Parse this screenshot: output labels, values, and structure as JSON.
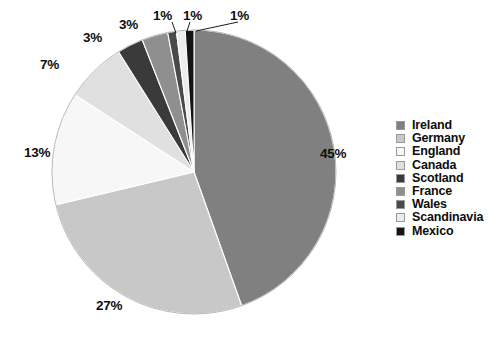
{
  "chart_data": {
    "type": "pie",
    "title": "",
    "subtitle": "",
    "xlabel": "",
    "ylabel": "",
    "grid": false,
    "legend_position": "right",
    "start_angle_deg": -90,
    "direction": "clockwise",
    "categories": [
      "Ireland",
      "Germany",
      "England",
      "Canada",
      "Scotland",
      "France",
      "Wales",
      "Scandinavia",
      "Mexico"
    ],
    "values": [
      45,
      27,
      13,
      7,
      3,
      3,
      1,
      1,
      1
    ],
    "value_labels": [
      "45%",
      "27%",
      "13%",
      "7%",
      "3%",
      "3%",
      "1%",
      "1%",
      "1%"
    ],
    "colors": [
      "#808080",
      "#c8c8c8",
      "#f7f7f7",
      "#e0e0e0",
      "#3a3a3a",
      "#8f8f8f",
      "#4a4a4a",
      "#ededed",
      "#141414"
    ],
    "slices": [
      {
        "label": "Ireland",
        "value": 45,
        "value_label": "45%",
        "color": "#808080"
      },
      {
        "label": "Germany",
        "value": 27,
        "value_label": "27%",
        "color": "#c8c8c8"
      },
      {
        "label": "England",
        "value": 13,
        "value_label": "13%",
        "color": "#f7f7f7"
      },
      {
        "label": "Canada",
        "value": 7,
        "value_label": "7%",
        "color": "#e0e0e0"
      },
      {
        "label": "Scotland",
        "value": 3,
        "value_label": "3%",
        "color": "#3a3a3a"
      },
      {
        "label": "France",
        "value": 3,
        "value_label": "3%",
        "color": "#8f8f8f"
      },
      {
        "label": "Wales",
        "value": 1,
        "value_label": "1%",
        "color": "#4a4a4a"
      },
      {
        "label": "Scandinavia",
        "value": 1,
        "value_label": "1%",
        "color": "#ededed"
      },
      {
        "label": "Mexico",
        "value": 1,
        "value_label": "1%",
        "color": "#141414"
      }
    ]
  },
  "legend": {
    "items": [
      {
        "label": "Ireland",
        "color": "#808080"
      },
      {
        "label": "Germany",
        "color": "#c8c8c8"
      },
      {
        "label": "England",
        "color": "#f7f7f7"
      },
      {
        "label": "Canada",
        "color": "#e0e0e0"
      },
      {
        "label": "Scotland",
        "color": "#3a3a3a"
      },
      {
        "label": "France",
        "color": "#8f8f8f"
      },
      {
        "label": "Wales",
        "color": "#4a4a4a"
      },
      {
        "label": "Scandinavia",
        "color": "#ededed"
      },
      {
        "label": "Mexico",
        "color": "#141414"
      }
    ]
  },
  "labels": {
    "ireland": "45%",
    "germany": "27%",
    "england": "13%",
    "canada": "7%",
    "scotland": "3%",
    "france": "3%",
    "wales": "1%",
    "scandinavia": "1%",
    "mexico": "1%"
  }
}
